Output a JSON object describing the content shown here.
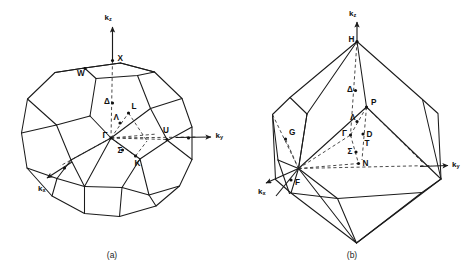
{
  "figure": {
    "type": "brillouin-zone-diagrams",
    "panels": [
      {
        "id": "a",
        "caption": "(a)",
        "lattice": "face-centered cubic (truncated octahedron)",
        "axes": [
          {
            "name": "kz",
            "base": "k",
            "sub": "z",
            "direction": "up"
          },
          {
            "name": "ky",
            "base": "k",
            "sub": "y",
            "direction": "right"
          },
          {
            "name": "kx",
            "base": "k",
            "sub": "x",
            "direction": "down-left"
          }
        ],
        "symmetry_points": [
          {
            "label": "X",
            "x": 112.5,
            "y": 60.5,
            "lx": 117.5,
            "ly": 59.0,
            "dot": true
          },
          {
            "label": "W",
            "x": 85.0,
            "y": 68.5,
            "lx": 77.0,
            "ly": 73.5,
            "dot": true
          },
          {
            "label": "Δ",
            "x": 112.5,
            "y": 103.0,
            "lx": 104.0,
            "ly": 102.0,
            "dot": true
          },
          {
            "label": "L",
            "x": 128.5,
            "y": 113.0,
            "lx": 131.5,
            "ly": 107.0,
            "dot": true
          },
          {
            "label": "Λ",
            "x": 120.0,
            "y": 123.0,
            "lx": 113.5,
            "ly": 118.0,
            "dot": true
          },
          {
            "label": "Γ",
            "x": 111.0,
            "y": 138.0,
            "lx": 102.5,
            "ly": 136.0,
            "dot": true
          },
          {
            "label": "U",
            "x": 167.0,
            "y": 139.5,
            "lx": 163.0,
            "ly": 131.0,
            "dot": true
          },
          {
            "label": "Σ",
            "x": 122.5,
            "y": 150.0,
            "lx": 117.5,
            "ly": 150.5,
            "dot": true
          },
          {
            "label": "K",
            "x": 135.5,
            "y": 156.0,
            "lx": 134.5,
            "ly": 163.5,
            "dot": true
          }
        ],
        "extra_dots": [
          {
            "x": 188.5,
            "y": 138.0
          },
          {
            "x": 64.5,
            "y": 168.0
          }
        ]
      },
      {
        "id": "b",
        "caption": "(b)",
        "lattice": "body-centered cubic (truncated octahedron)",
        "axes": [
          {
            "name": "kz",
            "base": "k",
            "sub": "z",
            "direction": "up"
          },
          {
            "name": "ky",
            "base": "k",
            "sub": "y",
            "direction": "right"
          },
          {
            "name": "kx",
            "base": "k",
            "sub": "x",
            "direction": "down-left"
          }
        ],
        "symmetry_points": [
          {
            "label": "H",
            "x": 357.0,
            "y": 41.5,
            "lx": 348.5,
            "ly": 40.0,
            "dot": true
          },
          {
            "label": "Δ",
            "x": 355.5,
            "y": 90.5,
            "lx": 347.0,
            "ly": 90.0,
            "dot": true
          },
          {
            "label": "P",
            "x": 366.5,
            "y": 107.0,
            "lx": 371.0,
            "ly": 103.0,
            "dot": true
          },
          {
            "label": "Λ",
            "x": 357.0,
            "y": 121.5,
            "lx": 350.0,
            "ly": 118.0,
            "dot": true
          },
          {
            "label": "Γ",
            "x": 350.5,
            "y": 135.0,
            "lx": 342.0,
            "ly": 134.0,
            "dot": true
          },
          {
            "label": "D",
            "x": 363.0,
            "y": 134.0,
            "lx": 366.5,
            "ly": 134.5,
            "dot": true
          },
          {
            "label": "T",
            "x": 361.0,
            "y": 145.0,
            "lx": 364.5,
            "ly": 144.0,
            "dot": false
          },
          {
            "label": "Σ",
            "x": 356.0,
            "y": 152.0,
            "lx": 347.5,
            "ly": 151.5,
            "dot": true
          },
          {
            "label": "N",
            "x": 358.5,
            "y": 163.5,
            "lx": 362.5,
            "ly": 164.0,
            "dot": true
          },
          {
            "label": "G",
            "x": 285.5,
            "y": 139.0,
            "lx": 289.0,
            "ly": 133.0,
            "dot": true
          },
          {
            "label": "F",
            "x": 291.0,
            "y": 180.0,
            "lx": 295.0,
            "ly": 182.5,
            "dot": true
          }
        ],
        "extra_dots": []
      }
    ]
  }
}
